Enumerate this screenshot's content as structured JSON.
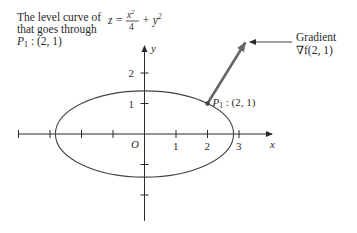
{
  "title_text": {
    "line1": "The level curve of",
    "line2": "that goes through",
    "point_label": "P",
    "point_sub": "1",
    "point_coords": " : (2, 1)",
    "equation_lhs": "z =",
    "equation_num": "x",
    "equation_num_exp": "2",
    "equation_den": "4",
    "equation_plus": "+ y",
    "equation_plus_exp": "2"
  },
  "gradient_label": {
    "line1": "Gradient",
    "line2": "∇f(2, 1)"
  },
  "axes": {
    "x_label": "x",
    "y_label": "y",
    "origin_label": "O",
    "x_ticks": [
      -4,
      -3,
      -2,
      -1,
      1,
      2,
      3
    ],
    "x_tick_labels": [
      {
        "value": 1,
        "label": "1"
      },
      {
        "value": 2,
        "label": "2"
      },
      {
        "value": 3,
        "label": "3"
      }
    ],
    "y_ticks": [
      -2,
      -1,
      1,
      2
    ],
    "y_tick_labels": [
      {
        "value": 1,
        "label": "1"
      },
      {
        "value": 2,
        "label": "2"
      }
    ]
  },
  "curve": {
    "equation": "x^2/4 + y^2 = 2",
    "semi_axis_x": 2.828,
    "semi_axis_y": 1.414
  },
  "point": {
    "x": 2,
    "y": 1,
    "label": "P",
    "sub": "1",
    "coords": " : (2, 1)"
  },
  "gradient": {
    "dx": 1,
    "dy": 2
  },
  "colors": {
    "ink": "#2a2a2a",
    "arrow": "#555555",
    "curve": "#444444"
  }
}
